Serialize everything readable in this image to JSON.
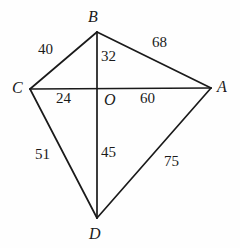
{
  "figure": {
    "type": "geometry-diagram",
    "shape_name": "quadrilateral ABCD with diagonals",
    "background_color": "#fefefe",
    "stroke_color": "#1a1a1a",
    "stroke_width": 1.6
  },
  "vertices": [
    {
      "id": "B",
      "label": "B",
      "x": 97,
      "y": 32,
      "label_x": 88,
      "label_y": 9
    },
    {
      "id": "C",
      "label": "C",
      "x": 30,
      "y": 89,
      "label_x": 12,
      "label_y": 80
    },
    {
      "id": "A",
      "label": "A",
      "x": 211,
      "y": 88,
      "label_x": 217,
      "label_y": 79
    },
    {
      "id": "D",
      "label": "D",
      "x": 97,
      "y": 218,
      "label_x": 89,
      "label_y": 226
    },
    {
      "id": "O",
      "label": "O",
      "x": 97,
      "y": 88,
      "label_x": 104,
      "label_y": 92
    }
  ],
  "edges": [
    {
      "id": "CB",
      "from": "C",
      "to": "B",
      "measure": "40",
      "label_x": 38,
      "label_y": 42
    },
    {
      "id": "BA",
      "from": "B",
      "to": "A",
      "measure": "68",
      "label_x": 152,
      "label_y": 35
    },
    {
      "id": "CD",
      "from": "C",
      "to": "D",
      "measure": "51",
      "label_x": 35,
      "label_y": 147
    },
    {
      "id": "DA",
      "from": "D",
      "to": "A",
      "measure": "75",
      "label_x": 164,
      "label_y": 154
    }
  ],
  "diagonal_segments": [
    {
      "id": "BO",
      "from": "B",
      "to": "O",
      "measure": "32",
      "label_x": 101,
      "label_y": 49
    },
    {
      "id": "CO",
      "from": "C",
      "to": "O",
      "measure": "24",
      "label_x": 56,
      "label_y": 91
    },
    {
      "id": "OA",
      "from": "O",
      "to": "A",
      "measure": "60",
      "label_x": 140,
      "label_y": 91
    },
    {
      "id": "OD",
      "from": "O",
      "to": "D",
      "measure": "45",
      "label_x": 101,
      "label_y": 145
    }
  ],
  "diagonals": [
    {
      "id": "CA",
      "from": "C",
      "to": "A"
    },
    {
      "id": "BD",
      "from": "B",
      "to": "D"
    }
  ]
}
